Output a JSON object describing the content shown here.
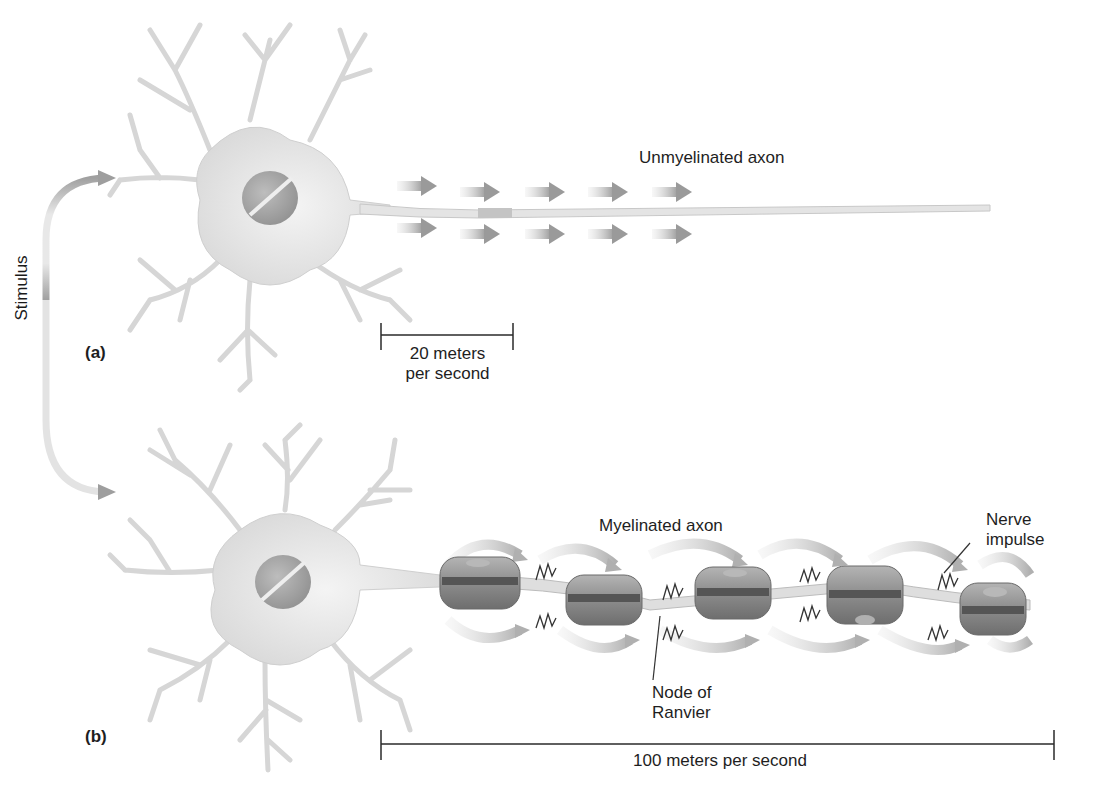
{
  "figure": {
    "type": "neuron-conduction-diagram",
    "stimulus_label": "Stimulus",
    "panels": [
      {
        "id": "a",
        "label": "(a)",
        "axon_label": "Unmyelinated axon",
        "speed_label_line1": "20 meters",
        "speed_label_line2": "per second",
        "speed_value": 20,
        "speed_unit": "meters per second",
        "arrow_rows": 2,
        "arrows_per_row": 5
      },
      {
        "id": "b",
        "label": "(b)",
        "axon_label": "Myelinated axon",
        "impulse_label_line1": "Nerve",
        "impulse_label_line2": "impulse",
        "node_label_line1": "Node of",
        "node_label_line2": "Ranvier",
        "speed_label": "100 meters per second",
        "speed_value": 100,
        "speed_unit": "meters per second",
        "myelin_segments": 5
      }
    ],
    "colors": {
      "neuron_fill": "#e3e3e3",
      "neuron_stroke": "#cfcfcf",
      "nucleus": "#a9a9a9",
      "arrow": "#a8a8a8",
      "myelin": "#8a8a8a",
      "myelin_dark": "#555555",
      "text": "#1e1e1e"
    }
  }
}
